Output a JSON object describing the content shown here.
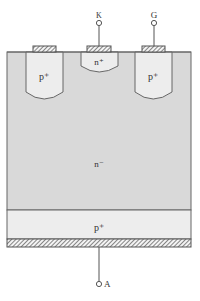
{
  "diagram": {
    "regions": {
      "n_drift": {
        "label": "n⁻",
        "fill": "#d9d9d9"
      },
      "p_anode": {
        "label": "p⁺",
        "fill": "#ededed"
      },
      "p_left": {
        "label": "p⁺",
        "fill": "#ededed"
      },
      "p_right": {
        "label": "p⁺",
        "fill": "#ededed"
      },
      "n_cathode": {
        "label": "n⁺",
        "fill": "#ededed"
      }
    },
    "terminals": {
      "cathode": {
        "label": "K"
      },
      "gate": {
        "label": "G"
      },
      "anode": {
        "label": "A"
      }
    },
    "colors": {
      "outline": "#555555",
      "metal_hatch": "#555555",
      "background": "#ffffff"
    }
  }
}
